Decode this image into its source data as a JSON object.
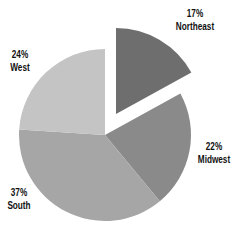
{
  "chart_data": {
    "type": "pie",
    "title": "",
    "legend": "none",
    "start_angle_deg": 0,
    "direction": "clockwise",
    "center": [
      105,
      135
    ],
    "radius": 86,
    "slices": [
      {
        "name": "Northeast",
        "value": 17,
        "label_pct": "17%",
        "color": "#6e6e6e",
        "exploded": true,
        "offset": [
          11,
          -21
        ],
        "label_pos": [
          195,
          7
        ]
      },
      {
        "name": "Midwest",
        "value": 22,
        "label_pct": "22%",
        "color": "#8a8a8a",
        "exploded": false,
        "offset": [
          0,
          0
        ],
        "label_pos": [
          214,
          140
        ]
      },
      {
        "name": "South",
        "value": 37,
        "label_pct": "37%",
        "color": "#a6a6a6",
        "exploded": false,
        "offset": [
          0,
          0
        ],
        "label_pos": [
          19,
          186
        ]
      },
      {
        "name": "West",
        "value": 24,
        "label_pct": "24%",
        "color": "#c4c4c4",
        "exploded": false,
        "offset": [
          0,
          0
        ],
        "label_pos": [
          20,
          48
        ]
      }
    ],
    "categories": [
      "Northeast",
      "Midwest",
      "South",
      "West"
    ],
    "values": [
      17,
      22,
      37,
      24
    ]
  },
  "labels": {
    "northeast": {
      "pct": "17%",
      "name": "Northeast"
    },
    "midwest": {
      "pct": "22%",
      "name": "Midwest"
    },
    "south": {
      "pct": "37%",
      "name": "South"
    },
    "west": {
      "pct": "24%",
      "name": "West"
    }
  }
}
